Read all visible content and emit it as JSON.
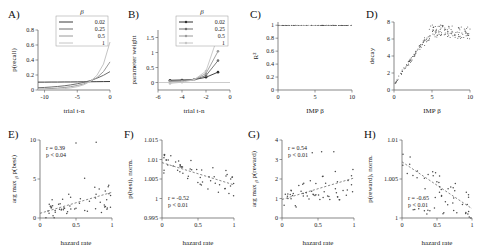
{
  "figure": {
    "panels": [
      "A",
      "B",
      "C",
      "D",
      "E",
      "F",
      "G",
      "H"
    ],
    "beta_symbol": "β"
  },
  "chart_data": [
    {
      "id": "A",
      "panel_label": "A)",
      "type": "line",
      "title": "",
      "xlabel": "trial t-n",
      "ylabel": "p(recall)",
      "xlim": [
        -11,
        0
      ],
      "ylim": [
        0,
        0.8
      ],
      "xticks": [
        -10,
        -5,
        0
      ],
      "xticklabels": [
        "-10",
        "-5",
        "0"
      ],
      "yticks": [
        0,
        0.2,
        0.4,
        0.6,
        0.8
      ],
      "yticklabels": [
        "0",
        "0.2",
        "0.4",
        "0.6",
        "0.8"
      ],
      "legend_title": "β",
      "legend_position": "upper-center",
      "legend": [
        "0.02",
        "0.25",
        "0.5",
        "1"
      ],
      "colors": [
        "#3a3a3a",
        "#6e6e6e",
        "#9a9a9a",
        "#c4c4c4"
      ],
      "x": [
        -11,
        -10,
        -9,
        -8,
        -7,
        -6,
        -5,
        -4,
        -3,
        -2,
        -1,
        0
      ],
      "series": [
        {
          "name": "0.02",
          "values": [
            0.105,
            0.105,
            0.106,
            0.106,
            0.107,
            0.107,
            0.108,
            0.109,
            0.11,
            0.111,
            0.112,
            0.113
          ]
        },
        {
          "name": "0.25",
          "values": [
            0.03,
            0.034,
            0.04,
            0.047,
            0.056,
            0.068,
            0.083,
            0.102,
            0.126,
            0.157,
            0.196,
            0.245
          ]
        },
        {
          "name": "0.5",
          "values": [
            0.012,
            0.015,
            0.019,
            0.025,
            0.033,
            0.044,
            0.06,
            0.082,
            0.115,
            0.165,
            0.245,
            0.375
          ]
        },
        {
          "name": "1",
          "values": [
            0.004,
            0.005,
            0.008,
            0.012,
            0.018,
            0.028,
            0.044,
            0.07,
            0.115,
            0.195,
            0.345,
            0.64
          ]
        }
      ]
    },
    {
      "id": "B",
      "panel_label": "B)",
      "type": "line",
      "title": "",
      "xlabel": "trial t-n",
      "ylabel": "parameter weight",
      "xlim": [
        -6,
        0
      ],
      "ylim": [
        -0.25,
        1.75
      ],
      "xticks": [
        -6,
        -4,
        -2,
        0
      ],
      "xticklabels": [
        "-6",
        "-4",
        "-2",
        "0"
      ],
      "yticks": [
        0,
        0.5,
        1,
        1.5
      ],
      "yticklabels": [
        "0",
        "0.5",
        "1",
        "1.5"
      ],
      "legend_title": "β",
      "legend_position": "upper-center",
      "legend": [
        "0.02",
        "0.25",
        "0.5",
        "1"
      ],
      "colors": [
        "#2e2e2e",
        "#6e6e6e",
        "#9a9a9a",
        "#c4c4c4"
      ],
      "x": [
        -5,
        -4,
        -3,
        -2,
        -1
      ],
      "series": [
        {
          "name": "0.02",
          "values": [
            0.075,
            0.085,
            0.095,
            0.175,
            0.345
          ],
          "markers": true
        },
        {
          "name": "0.25",
          "values": [
            0.055,
            0.06,
            0.09,
            0.23,
            0.73
          ],
          "markers": true
        },
        {
          "name": "0.5",
          "values": [
            0.03,
            0.045,
            0.095,
            0.3,
            1.04
          ],
          "markers": true
        },
        {
          "name": "1",
          "values": [
            -0.03,
            0.01,
            0.09,
            0.38,
            1.56
          ],
          "markers": true
        }
      ]
    },
    {
      "id": "C",
      "panel_label": "C)",
      "type": "scatter",
      "title": "",
      "xlabel": "IMP β",
      "ylabel": "R²",
      "xlim": [
        0,
        10
      ],
      "ylim": [
        0,
        1.05
      ],
      "xticks": [
        0,
        5,
        10
      ],
      "xticklabels": [
        "0",
        "5",
        "10"
      ],
      "yticks": [
        0,
        0.2,
        0.4,
        0.6,
        0.8,
        1
      ],
      "yticklabels": [
        "0",
        "0.2",
        "0.4",
        "0.6",
        "0.8",
        "1"
      ],
      "note": "dense points at R2 = 1.0 across full x range",
      "n_points": 120,
      "y_mean": 0.999
    },
    {
      "id": "D",
      "panel_label": "D)",
      "type": "scatter",
      "title": "",
      "xlabel": "IMP β",
      "ylabel": "decay",
      "xlim": [
        0,
        10
      ],
      "ylim": [
        0,
        8
      ],
      "xticks": [
        0,
        5,
        10
      ],
      "xticklabels": [
        "0",
        "5",
        "10"
      ],
      "yticks": [
        0,
        2,
        4,
        6,
        8
      ],
      "yticklabels": [
        "0",
        "2",
        "4",
        "6",
        "8"
      ],
      "note": "rises steeply from ~0.8 at beta=0 to ~7 at beta=5 then plateaus/scatters near 6.5-7.3"
    },
    {
      "id": "E",
      "panel_label": "E)",
      "type": "scatter",
      "title": "",
      "xlabel": "hazard rate",
      "ylabel": "arg max β p(best)",
      "ylabel_main": "arg max",
      "ylabel_sub": "β",
      "ylabel_tail": "p(best)",
      "xlim": [
        0,
        1
      ],
      "ylim": [
        0,
        10
      ],
      "xticks": [
        0,
        0.5,
        1
      ],
      "xticklabels": [
        "0",
        "0.5",
        "1"
      ],
      "yticks": [
        0,
        5,
        10
      ],
      "yticklabels": [
        "0",
        "5",
        "10"
      ],
      "stats": {
        "r": "r = 0.39",
        "p": "p < 0.04"
      },
      "fit": {
        "x0": 0,
        "y0": 0.6,
        "x1": 1,
        "y1": 3.3
      }
    },
    {
      "id": "F",
      "panel_label": "F)",
      "type": "scatter",
      "title": "",
      "xlabel": "hazard rate",
      "ylabel": "p(best), norm.",
      "xlim": [
        0,
        1
      ],
      "ylim": [
        0.995,
        1.015
      ],
      "xticks": [
        0,
        0.5,
        1
      ],
      "xticklabels": [
        "0",
        "0.5",
        "1"
      ],
      "yticks": [
        0.995,
        1,
        1.005,
        1.01,
        1.015
      ],
      "yticklabels": [
        "0.995",
        "1",
        "1.005",
        "1.01",
        "1.015"
      ],
      "stats": {
        "r": "r = -0.52",
        "p": "p < 0.01"
      },
      "fit": {
        "x0": 0,
        "y0": 1.0092,
        "x1": 1,
        "y1": 1.0035
      }
    },
    {
      "id": "G",
      "panel_label": "G)",
      "type": "scatter",
      "title": "",
      "xlabel": "hazard rate",
      "ylabel": "arg max β p(reward)",
      "ylabel_main": "arg max",
      "ylabel_sub": "β",
      "ylabel_tail": "p(reward)",
      "xlim": [
        0,
        1
      ],
      "ylim": [
        0,
        4
      ],
      "xticks": [
        0,
        0.5,
        1
      ],
      "xticklabels": [
        "0",
        "0.5",
        "1"
      ],
      "yticks": [
        0,
        1,
        2,
        3,
        4
      ],
      "yticklabels": [
        "0",
        "1",
        "2",
        "3",
        "4"
      ],
      "stats": {
        "r": "r = 0.54",
        "p": "p < 0.01"
      },
      "fit": {
        "x0": 0,
        "y0": 0.95,
        "x1": 1,
        "y1": 2.05
      }
    },
    {
      "id": "H",
      "panel_label": "H)",
      "type": "scatter",
      "title": "",
      "xlabel": "hazard rate",
      "ylabel": "p(reward), norm.",
      "xlim": [
        0,
        1
      ],
      "ylim": [
        1,
        1.01
      ],
      "xticks": [
        0,
        0.5,
        1
      ],
      "xticklabels": [
        "0",
        "0.5",
        "1"
      ],
      "yticks": [
        1,
        1.005,
        1.01
      ],
      "yticklabels": [
        "1",
        "1.005",
        "1.01"
      ],
      "stats": {
        "r": "r = -0.65",
        "p": "p < 0.01"
      },
      "fit": {
        "x0": 0,
        "y0": 1.0072,
        "x1": 1,
        "y1": 1.0012
      }
    }
  ]
}
